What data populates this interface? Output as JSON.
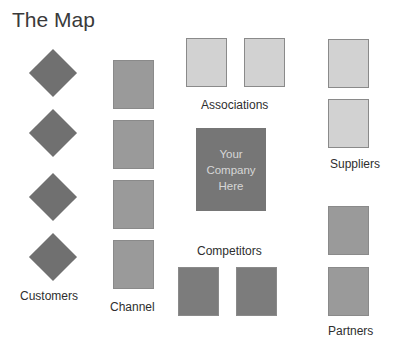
{
  "title": "The Map",
  "colors": {
    "diamond": "#707070",
    "channel": "#9a9a9a",
    "associations": "#d2d2d2",
    "suppliers": "#d2d2d2",
    "company": "#767676",
    "company_text": "#d6d6d6",
    "competitors": "#7c7c7c",
    "partners": "#9a9a9a"
  },
  "groups": {
    "customers": {
      "label": "Customers",
      "count": 4
    },
    "channel": {
      "label": "Channel",
      "count": 4
    },
    "associations": {
      "label": "Associations",
      "count": 2
    },
    "suppliers": {
      "label": "Suppliers",
      "count": 2
    },
    "company": {
      "lines": [
        "Your",
        "Company",
        "Here"
      ]
    },
    "competitors": {
      "label": "Competitors",
      "count": 2
    },
    "partners": {
      "label": "Partners",
      "count": 2
    }
  }
}
